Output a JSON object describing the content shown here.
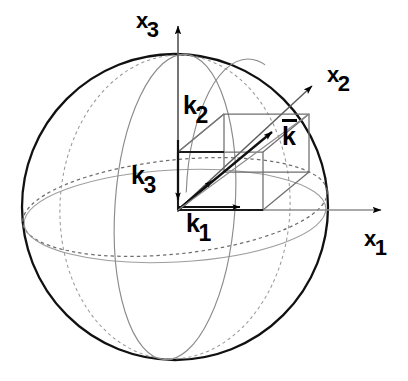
{
  "figure": {
    "type": "geometry-diagram",
    "width": 408,
    "height": 381,
    "background": "#ffffff",
    "ink_color": "#000000",
    "construction_color": "#8c8c8c",
    "hidden_color": "#9a9a9a"
  },
  "axes": {
    "x1": {
      "label_base": "x",
      "label_sub": "1",
      "direction": "right",
      "label_x": 364,
      "label_y": 228
    },
    "x2": {
      "label_base": "x",
      "label_sub": "2",
      "direction": "up-right",
      "label_x": 327,
      "label_y": 64
    },
    "x3": {
      "label_base": "x",
      "label_sub": "3",
      "direction": "up",
      "label_x": 136,
      "label_y": 10
    }
  },
  "components": {
    "k1": {
      "label_base": "k",
      "label_sub": "1",
      "label_x": 186,
      "label_y": 211,
      "meaning": "component along x1"
    },
    "k2": {
      "label_base": "k",
      "label_sub": "2",
      "label_x": 183,
      "label_y": 93,
      "meaning": "component along x3"
    },
    "k3": {
      "label_base": "k",
      "label_sub": "3",
      "label_x": 131,
      "label_y": 163,
      "meaning": "component along x2"
    }
  },
  "vector": {
    "k": {
      "label_base": "k",
      "overbar": true,
      "label_x": 282,
      "label_y": 124,
      "meaning": "wave vector"
    }
  },
  "sphere": {
    "center_x": 175,
    "center_y": 207,
    "radius": 153,
    "equator": "dashed-ellipse",
    "meridians": [
      "solid-ellipse",
      "dashed-ellipse"
    ]
  },
  "box": {
    "description": "wireframe parallelepiped whose space diagonal is the vector k",
    "origin_x": 178,
    "origin_y": 210
  }
}
